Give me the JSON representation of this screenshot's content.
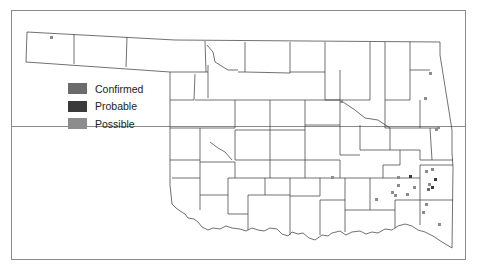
{
  "map": {
    "title": "",
    "region": "Oklahoma counties",
    "border_color": "#8a8a8a",
    "county_line_color": "#333333"
  },
  "legend": {
    "items": [
      {
        "label": "Confirmed",
        "color": "#6b6b6b"
      },
      {
        "label": "Probable",
        "color": "#3a3a3a"
      },
      {
        "label": "Possible",
        "color": "#8c8c8c"
      }
    ]
  },
  "points": [
    {
      "x": 51,
      "y": 37,
      "status": "Possible"
    },
    {
      "x": 430,
      "y": 73,
      "status": "Possible"
    },
    {
      "x": 341,
      "y": 101,
      "status": "Possible"
    },
    {
      "x": 425,
      "y": 98,
      "status": "Possible"
    },
    {
      "x": 436,
      "y": 129,
      "status": "Possible"
    },
    {
      "x": 438,
      "y": 127,
      "status": "Possible"
    },
    {
      "x": 332,
      "y": 177,
      "status": "Possible"
    },
    {
      "x": 398,
      "y": 177,
      "status": "Possible"
    },
    {
      "x": 410,
      "y": 176,
      "status": "Probable"
    },
    {
      "x": 426,
      "y": 171,
      "status": "Possible"
    },
    {
      "x": 432,
      "y": 169,
      "status": "Possible"
    },
    {
      "x": 435,
      "y": 179,
      "status": "Probable"
    },
    {
      "x": 398,
      "y": 185,
      "status": "Possible"
    },
    {
      "x": 414,
      "y": 187,
      "status": "Possible"
    },
    {
      "x": 429,
      "y": 184,
      "status": "Possible"
    },
    {
      "x": 432,
      "y": 187,
      "status": "Probable"
    },
    {
      "x": 428,
      "y": 189,
      "status": "Confirmed"
    },
    {
      "x": 392,
      "y": 192,
      "status": "Possible"
    },
    {
      "x": 395,
      "y": 195,
      "status": "Possible"
    },
    {
      "x": 407,
      "y": 194,
      "status": "Possible"
    },
    {
      "x": 376,
      "y": 199,
      "status": "Possible"
    },
    {
      "x": 426,
      "y": 204,
      "status": "Possible"
    },
    {
      "x": 423,
      "y": 212,
      "status": "Possible"
    },
    {
      "x": 439,
      "y": 224,
      "status": "Possible"
    }
  ]
}
